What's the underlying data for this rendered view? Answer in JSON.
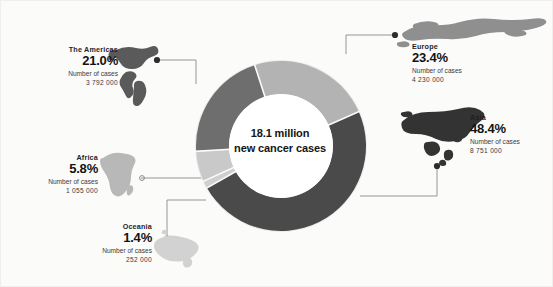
{
  "center": {
    "line1": "18.1 million",
    "line2": "new cancer cases"
  },
  "labels": {
    "number_of_cases_text": "Number of cases"
  },
  "regions": [
    {
      "id": "the-americas",
      "name": "The Americas",
      "percent": "21.0%",
      "cases_label": "Number of cases",
      "cases": "3 792 000",
      "color": "#6e6e6e",
      "map_icon": "americas-map-icon"
    },
    {
      "id": "europe",
      "name": "Europe",
      "percent": "23.4%",
      "cases_label": "Number of cases",
      "cases": "4 230 000",
      "color": "#b3b3b3",
      "map_icon": "europe-map-icon"
    },
    {
      "id": "asia",
      "name": "Asia",
      "percent": "48.4%",
      "cases_label": "Number of cases",
      "cases": "8 751 000",
      "color": "#4a4a4a",
      "map_icon": "asia-map-icon"
    },
    {
      "id": "africa",
      "name": "Africa",
      "percent": "5.8%",
      "cases_label": "Number of cases",
      "cases": "1 055 000",
      "color": "#c9c9c9",
      "map_icon": "africa-map-icon"
    },
    {
      "id": "oceania",
      "name": "Oceania",
      "percent": "1.4%",
      "cases_label": "Number of cases",
      "cases": "252 000",
      "color": "#cfcfcf",
      "map_icon": "oceania-map-icon"
    }
  ],
  "chart_data": {
    "type": "pie",
    "title": "18.1 million new cancer cases",
    "subtitle": "",
    "xlabel": "",
    "ylabel": "",
    "donut": true,
    "inner_radius_ratio": 0.61,
    "start_angle_deg": -18,
    "direction": "clockwise",
    "legend": "callout labels around chart",
    "grid": false,
    "categories": [
      "Europe",
      "Asia",
      "Oceania",
      "Africa",
      "The Americas"
    ],
    "values": [
      23.4,
      48.4,
      1.4,
      5.8,
      21.0
    ],
    "value_unit": "percent",
    "counts": [
      4230000,
      8751000,
      252000,
      1055000,
      3792000
    ],
    "count_labels": [
      "4 230 000",
      "8 751 000",
      "252 000",
      "1 055 000",
      "3 792 000"
    ],
    "colors": [
      "#b3b3b3",
      "#4a4a4a",
      "#cfcfcf",
      "#c9c9c9",
      "#6e6e6e"
    ],
    "total_label": "18.1 million",
    "total": 18080000
  }
}
